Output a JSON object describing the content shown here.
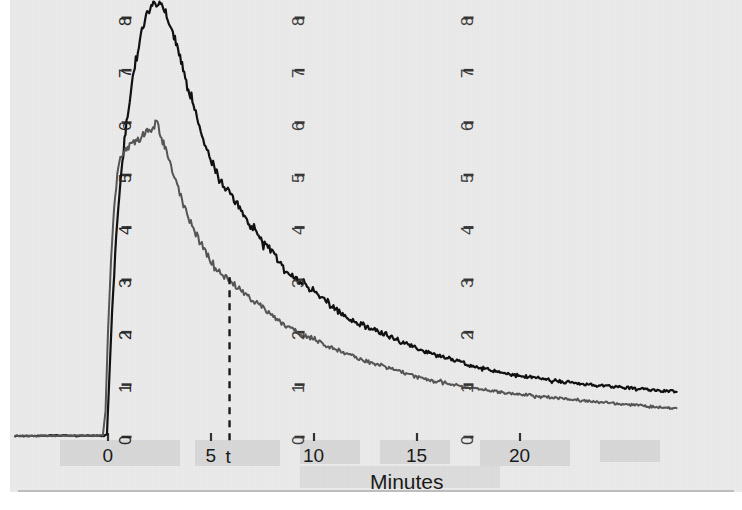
{
  "figure": {
    "background_color": "#ebebeb",
    "page_color": "#ffffff"
  },
  "axis": {
    "x_title": "Minutes",
    "x_tick_labels": [
      "0",
      "5",
      "10",
      "15",
      "20"
    ],
    "y_tick_labels": [
      "0",
      "1",
      "2",
      "3",
      "4",
      "5",
      "6",
      "7",
      "8"
    ],
    "marker_label": "t"
  },
  "chart_data": {
    "type": "line",
    "title": "",
    "xlabel": "Minutes",
    "ylabel": "",
    "xlim": [
      -4.5,
      28
    ],
    "ylim": [
      -0.35,
      8.6
    ],
    "grid": false,
    "legend": "none",
    "annotations": [
      {
        "label": "t",
        "type": "vertical-dashed-line",
        "x": 5.9,
        "y_top": 3.05,
        "y_bottom": 0.0,
        "color": "#1a1a1a"
      }
    ],
    "y_axes_replicated_at_x": [
      0.9,
      9.3,
      17.5
    ],
    "series": [
      {
        "name": "upper-trace",
        "color": "#111111",
        "linewidth": 2.2,
        "x": [
          -4.5,
          -3.5,
          -2.5,
          -1.5,
          -0.6,
          -0.2,
          -0.05,
          0.05,
          0.2,
          0.35,
          0.5,
          0.7,
          0.9,
          1.1,
          1.3,
          1.5,
          1.7,
          1.9,
          2.05,
          2.2,
          2.35,
          2.5,
          2.65,
          2.8,
          3.0,
          3.2,
          3.45,
          3.7,
          3.95,
          4.2,
          4.5,
          4.8,
          5.1,
          5.4,
          5.7,
          6.0,
          6.4,
          6.8,
          7.2,
          7.6,
          8.0,
          8.5,
          9.0,
          9.5,
          10.0,
          10.5,
          11.0,
          11.5,
          12.0,
          12.5,
          13.0,
          13.5,
          14.0,
          14.5,
          15.0,
          15.5,
          16.0,
          16.5,
          17.0,
          17.5,
          18.0,
          18.6,
          19.2,
          19.8,
          20.4,
          21.0,
          21.6,
          22.2,
          22.8,
          23.4,
          24.0,
          24.6,
          25.2,
          25.8,
          26.4,
          27.0,
          27.6
        ],
        "y": [
          0.02,
          0.02,
          0.03,
          0.02,
          0.03,
          0.02,
          0.05,
          1.0,
          2.4,
          3.5,
          4.4,
          5.3,
          6.0,
          6.6,
          7.1,
          7.5,
          7.85,
          8.1,
          8.15,
          8.28,
          8.15,
          8.3,
          8.22,
          8.1,
          7.9,
          7.65,
          7.3,
          6.95,
          6.6,
          6.25,
          5.85,
          5.5,
          5.2,
          4.95,
          4.75,
          4.6,
          4.35,
          4.1,
          3.9,
          3.7,
          3.5,
          3.25,
          3.05,
          2.9,
          2.75,
          2.6,
          2.45,
          2.3,
          2.2,
          2.1,
          2.05,
          1.95,
          1.85,
          1.78,
          1.7,
          1.62,
          1.55,
          1.5,
          1.45,
          1.38,
          1.32,
          1.28,
          1.22,
          1.18,
          1.15,
          1.12,
          1.08,
          1.05,
          1.02,
          1.0,
          0.98,
          0.96,
          0.94,
          0.92,
          0.9,
          0.88,
          0.86
        ]
      },
      {
        "name": "lower-trace",
        "color": "#555555",
        "linewidth": 2.0,
        "x": [
          -4.5,
          -3.5,
          -2.5,
          -1.5,
          -0.6,
          -0.25,
          -0.12,
          0.0,
          0.15,
          0.3,
          0.45,
          0.6,
          0.8,
          1.0,
          1.2,
          1.4,
          1.6,
          1.8,
          2.0,
          2.2,
          2.4,
          2.6,
          2.8,
          3.0,
          3.3,
          3.6,
          3.9,
          4.2,
          4.5,
          4.8,
          5.1,
          5.4,
          5.7,
          5.9,
          6.2,
          6.6,
          7.0,
          7.4,
          7.8,
          8.2,
          8.7,
          9.2,
          9.7,
          10.2,
          10.7,
          11.2,
          11.7,
          12.2,
          12.7,
          13.2,
          13.7,
          14.2,
          14.7,
          15.2,
          15.7,
          16.2,
          16.8,
          17.4,
          18.0,
          18.6,
          19.2,
          19.8,
          20.4,
          21.0,
          21.6,
          22.2,
          22.8,
          23.4,
          24.0,
          24.6,
          25.2,
          25.8,
          26.4,
          27.0,
          27.6
        ],
        "y": [
          0.02,
          0.02,
          0.02,
          0.03,
          0.02,
          0.03,
          0.5,
          2.0,
          3.4,
          4.4,
          5.0,
          5.35,
          5.45,
          5.55,
          5.6,
          5.62,
          5.72,
          5.8,
          5.92,
          5.85,
          5.95,
          5.7,
          5.5,
          5.2,
          4.85,
          4.5,
          4.2,
          3.95,
          3.7,
          3.5,
          3.3,
          3.15,
          3.05,
          3.02,
          2.9,
          2.75,
          2.62,
          2.5,
          2.38,
          2.25,
          2.1,
          2.0,
          1.9,
          1.82,
          1.72,
          1.65,
          1.58,
          1.5,
          1.42,
          1.38,
          1.3,
          1.25,
          1.18,
          1.12,
          1.08,
          1.05,
          1.0,
          0.95,
          0.92,
          0.88,
          0.85,
          0.82,
          0.8,
          0.78,
          0.75,
          0.73,
          0.7,
          0.68,
          0.66,
          0.64,
          0.62,
          0.6,
          0.58,
          0.56,
          0.55
        ]
      }
    ]
  }
}
